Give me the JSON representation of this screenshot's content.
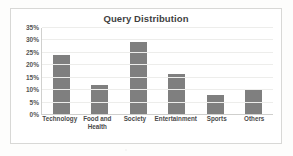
{
  "chart_data": {
    "type": "bar",
    "title": "Query Distribution",
    "categories": [
      "Technology",
      "Food and Health",
      "Society",
      "Entertainment",
      "Sports",
      "Others"
    ],
    "values": [
      24,
      12,
      29.5,
      16.5,
      8,
      10
    ],
    "xlabel": "",
    "ylabel": "",
    "ylim": [
      0,
      35
    ],
    "ytick_labels": [
      "35%",
      "30%",
      "25%",
      "20%",
      "15%",
      "10%",
      "5%",
      "0%"
    ],
    "ytick_values": [
      35,
      30,
      25,
      20,
      15,
      10,
      5,
      0
    ],
    "grid": true,
    "legend": false,
    "bar_color": "#7f7f7f",
    "gridline_color": "#ededeb",
    "title_color": "#3f3f3f"
  }
}
